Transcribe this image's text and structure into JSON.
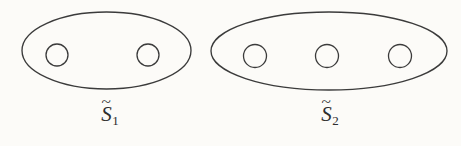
{
  "figure": {
    "type": "topological-surface-diagram",
    "background_color": "#fcfbf8",
    "stroke_color": "#3b3b3b",
    "surfaces": [
      {
        "id": "surface-1",
        "label_base": "S",
        "label_accent": "~",
        "label_subscript": "1",
        "label_text": "S̃1",
        "hole_count": 2,
        "ellipse": {
          "cx": 106.5,
          "cy": 50.5,
          "rx": 84.5,
          "ry": 38.5
        },
        "holes": [
          {
            "cx": 57,
            "cy": 55,
            "r": 11
          },
          {
            "cx": 148,
            "cy": 55,
            "r": 11
          }
        ],
        "label_position": {
          "x": 110,
          "y": 104
        }
      },
      {
        "id": "surface-2",
        "label_base": "S",
        "label_accent": "~",
        "label_subscript": "2",
        "label_text": "S̃2",
        "hole_count": 3,
        "ellipse": {
          "cx": 329,
          "cy": 51,
          "rx": 118,
          "ry": 39
        },
        "holes": [
          {
            "cx": 255,
            "cy": 56,
            "r": 11.5
          },
          {
            "cx": 327,
            "cy": 56,
            "r": 11.5
          },
          {
            "cx": 400,
            "cy": 56,
            "r": 11.5
          }
        ],
        "label_position": {
          "x": 330,
          "y": 104
        }
      }
    ]
  }
}
